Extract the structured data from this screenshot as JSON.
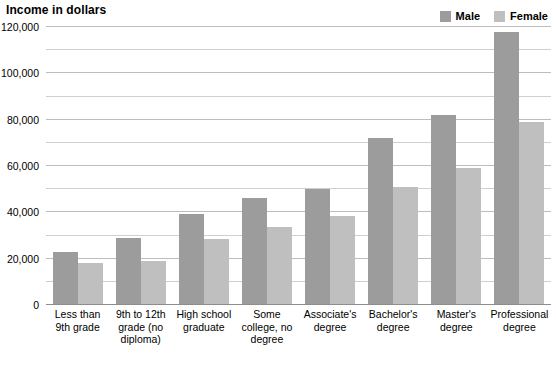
{
  "chart_data": {
    "type": "bar",
    "title": "Income in dollars",
    "subtitle": "",
    "xlabel": "",
    "ylabel": "",
    "ylim": [
      0,
      120000
    ],
    "grid": true,
    "grid_major_step": 20000,
    "grid_minor_step": 10000,
    "legend_position": "top-right",
    "categories": [
      "Less than 9th grade",
      "9th to 12th grade (no diploma)",
      "High school graduate",
      "Some college, no degree",
      "Associate's degree",
      "Bachelor's degree",
      "Master's degree",
      "Professional degree"
    ],
    "ytick_labels": [
      "0",
      "20,000",
      "40,000",
      "60,000",
      "80,000",
      "100,000",
      "120,000"
    ],
    "ytick_values": [
      0,
      20000,
      40000,
      60000,
      80000,
      100000,
      120000
    ],
    "series": [
      {
        "name": "Male",
        "color": "#9c9c9c",
        "values": [
          23000,
          29000,
          39500,
          46000,
          50000,
          72000,
          82000,
          118000
        ]
      },
      {
        "name": "Female",
        "color": "#bfbfbf",
        "values": [
          18000,
          19000,
          28500,
          33500,
          38500,
          51000,
          59000,
          79000
        ]
      }
    ]
  },
  "xlabel_lines": [
    [
      "Less than",
      "9th grade"
    ],
    [
      "9th to 12th",
      "grade (no",
      "diploma)"
    ],
    [
      "High school",
      "graduate"
    ],
    [
      "Some",
      "college, no",
      "degree"
    ],
    [
      "Associate's",
      "degree"
    ],
    [
      "Bachelor's",
      "degree"
    ],
    [
      "Master's",
      "degree"
    ],
    [
      "Professional",
      "degree"
    ]
  ]
}
